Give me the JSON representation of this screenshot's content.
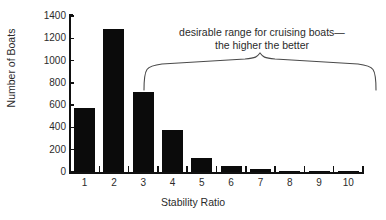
{
  "figure": {
    "background_color": "#ffffff",
    "bar_color": "#0b0b0b",
    "axis_color": "#111111",
    "text_color": "#2b2b2b"
  },
  "annotation": {
    "line1": "desirable range for cruising boats—",
    "line2": "the higher the better",
    "brace_label": "curly-brace",
    "span_start_category": "3",
    "span_end_category": "10"
  },
  "chart_data": {
    "type": "bar",
    "title": "",
    "xlabel": "Stability Ratio",
    "ylabel": "Number of Boats",
    "categories": [
      "1",
      "2",
      "3",
      "4",
      "5",
      "6",
      "7",
      "8",
      "9",
      "10"
    ],
    "values": [
      575,
      1280,
      720,
      380,
      130,
      50,
      28,
      12,
      8,
      6
    ],
    "ylim": [
      0,
      1400
    ],
    "yticks": [
      0,
      200,
      400,
      600,
      800,
      1000,
      1200,
      1400
    ],
    "ytick_labels": [
      "0",
      "200",
      "400",
      "600",
      "800",
      "1000",
      "1200",
      "1400"
    ],
    "grid": false,
    "legend": null,
    "annotations": [
      {
        "text": "desirable range for cruising boats—the higher the better",
        "type": "brace-bracket",
        "covers": [
          "3",
          "4",
          "5",
          "6",
          "7",
          "8",
          "9",
          "10"
        ]
      }
    ]
  }
}
